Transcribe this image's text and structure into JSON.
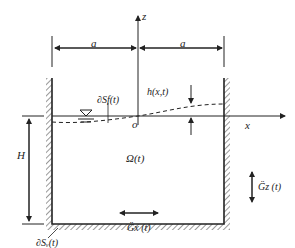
{
  "diagram": {
    "labels": {
      "z_axis": "z",
      "x_axis": "x",
      "origin": "o",
      "half_width_left": "a",
      "half_width_right": "a",
      "wave_height": "h(x,t)",
      "free_surface": "∂Sf(t)",
      "fluid_domain": "Ω(t)",
      "depth": "H",
      "wetted_boundary": "∂Sᵥ(t)",
      "vertical_accel": "G̈z (t)",
      "horizontal_accel": "G̈x (t)"
    },
    "colors": {
      "line": "#222222",
      "background": "#ffffff"
    }
  }
}
